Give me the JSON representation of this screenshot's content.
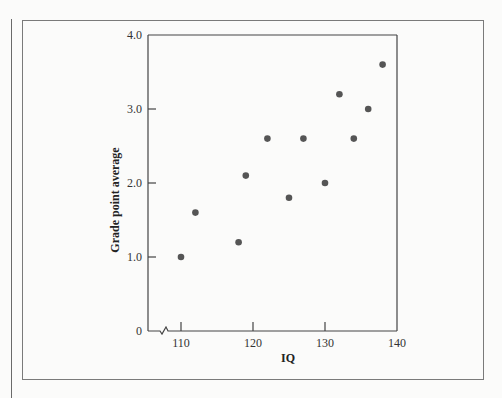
{
  "chart_data": {
    "type": "scatter",
    "title": "",
    "xlabel": "IQ",
    "ylabel": "Grade point average",
    "xlim": [
      107,
      140
    ],
    "ylim": [
      0,
      4.0
    ],
    "x_axis_break": true,
    "grid": false,
    "legend": null,
    "x_ticks": [
      110,
      120,
      130,
      140
    ],
    "x_tick_labels": [
      "110",
      "120",
      "130",
      "140"
    ],
    "y_ticks": [
      0,
      1.0,
      2.0,
      3.0,
      4.0
    ],
    "y_tick_labels": [
      "0",
      "1.0",
      "2.0",
      "3.0",
      "4.0"
    ],
    "points": [
      {
        "x": 110,
        "y": 1.0
      },
      {
        "x": 112,
        "y": 1.6
      },
      {
        "x": 118,
        "y": 1.2
      },
      {
        "x": 119,
        "y": 2.1
      },
      {
        "x": 122,
        "y": 2.6
      },
      {
        "x": 125,
        "y": 1.8
      },
      {
        "x": 127,
        "y": 2.6
      },
      {
        "x": 130,
        "y": 2.0
      },
      {
        "x": 132,
        "y": 3.2
      },
      {
        "x": 134,
        "y": 2.6
      },
      {
        "x": 136,
        "y": 3.0
      },
      {
        "x": 138,
        "y": 3.6
      }
    ],
    "colors": {
      "point": "#555555",
      "axis": "#444444"
    }
  }
}
